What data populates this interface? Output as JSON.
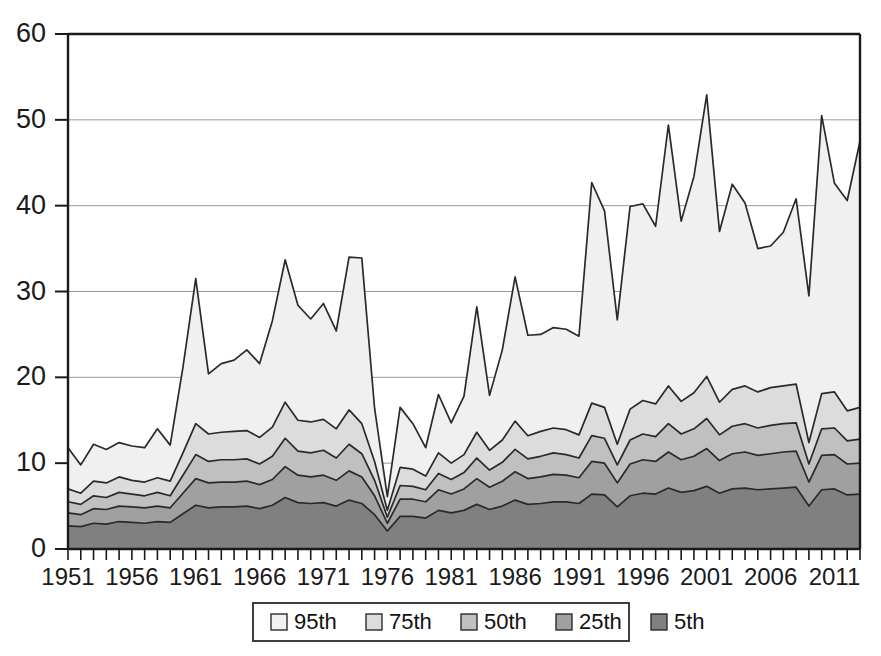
{
  "chart_data": {
    "type": "area",
    "stacked": false,
    "title": "",
    "subtitle": "",
    "xlabel": "",
    "ylabel": "",
    "xlim": [
      1951,
      2013
    ],
    "ylim": [
      0,
      60
    ],
    "ytick_values": [
      0,
      10,
      20,
      30,
      40,
      50,
      60
    ],
    "ytick_labels": [
      "0",
      "10",
      "20",
      "30",
      "40",
      "50",
      "60"
    ],
    "xtick_labels": [
      "1951",
      "1956",
      "1961",
      "1966",
      "1971",
      "1976",
      "1981",
      "1986",
      "1991",
      "1996",
      "2001",
      "2006",
      "2011"
    ],
    "xtick_values": [
      1951,
      1956,
      1961,
      1966,
      1971,
      1976,
      1981,
      1986,
      1991,
      1996,
      2001,
      2006,
      2011
    ],
    "grid": "horizontal",
    "legend_position": "bottom",
    "x": [
      1951,
      1952,
      1953,
      1954,
      1955,
      1956,
      1957,
      1958,
      1959,
      1960,
      1961,
      1962,
      1963,
      1964,
      1965,
      1966,
      1967,
      1968,
      1969,
      1970,
      1971,
      1972,
      1973,
      1974,
      1975,
      1976,
      1977,
      1978,
      1979,
      1980,
      1981,
      1982,
      1983,
      1984,
      1985,
      1986,
      1987,
      1988,
      1989,
      1990,
      1991,
      1992,
      1993,
      1994,
      1995,
      1996,
      1997,
      1998,
      1999,
      2000,
      2001,
      2002,
      2003,
      2004,
      2005,
      2006,
      2007,
      2008,
      2009,
      2010,
      2011,
      2012,
      2013
    ],
    "series": [
      {
        "name": "95th",
        "color": "#f0f0f0",
        "values": [
          11.8,
          9.8,
          12.2,
          11.6,
          12.4,
          12.0,
          11.8,
          14.0,
          12.1,
          21.2,
          31.5,
          20.4,
          21.6,
          22.0,
          23.2,
          21.6,
          26.6,
          33.7,
          28.4,
          26.8,
          28.6,
          25.4,
          34.0,
          33.9,
          16.4,
          6.1,
          16.5,
          14.6,
          11.8,
          18.0,
          14.7,
          17.8,
          28.2,
          17.9,
          23.2,
          31.7,
          24.9,
          25.0,
          25.8,
          25.6,
          24.8,
          42.7,
          39.4,
          26.7,
          39.9,
          40.2,
          37.6,
          49.4,
          38.2,
          43.4,
          52.9,
          37.0,
          42.5,
          40.3,
          35.0,
          35.3,
          36.9,
          40.8,
          29.5,
          50.5,
          42.6,
          40.6,
          47.5
        ]
      },
      {
        "name": "75th",
        "color": "#dcdcdc",
        "values": [
          7.0,
          6.5,
          7.9,
          7.7,
          8.4,
          8.0,
          7.8,
          8.3,
          7.9,
          11.2,
          14.6,
          13.4,
          13.6,
          13.7,
          13.8,
          13.0,
          14.2,
          17.1,
          15.0,
          14.8,
          15.1,
          14.0,
          16.2,
          14.6,
          10.2,
          4.5,
          9.5,
          9.3,
          8.5,
          11.2,
          10.0,
          11.0,
          13.6,
          11.5,
          12.7,
          14.9,
          13.2,
          13.7,
          14.1,
          13.9,
          13.3,
          17.0,
          16.5,
          12.2,
          16.3,
          17.3,
          16.9,
          19.0,
          17.2,
          18.2,
          20.1,
          17.1,
          18.6,
          19.0,
          18.3,
          18.8,
          19.0,
          19.2,
          12.4,
          18.1,
          18.3,
          16.1,
          16.5
        ]
      },
      {
        "name": "50th",
        "color": "#c0c0c0",
        "values": [
          5.5,
          5.2,
          6.2,
          6.0,
          6.6,
          6.4,
          6.2,
          6.6,
          6.2,
          8.6,
          11.0,
          10.2,
          10.4,
          10.4,
          10.5,
          9.9,
          10.8,
          12.9,
          11.4,
          11.2,
          11.5,
          10.6,
          12.2,
          11.1,
          8.0,
          3.7,
          7.4,
          7.3,
          6.9,
          8.8,
          8.1,
          8.9,
          10.6,
          9.2,
          10.1,
          11.6,
          10.5,
          10.8,
          11.2,
          11.0,
          10.6,
          13.2,
          12.9,
          9.8,
          12.7,
          13.4,
          13.1,
          14.6,
          13.4,
          14.0,
          15.2,
          13.3,
          14.3,
          14.6,
          14.1,
          14.4,
          14.6,
          14.7,
          9.9,
          14.0,
          14.1,
          12.6,
          12.8
        ]
      },
      {
        "name": "25th",
        "color": "#a0a0a0",
        "values": [
          4.2,
          4.0,
          4.7,
          4.6,
          5.0,
          4.9,
          4.8,
          5.0,
          4.8,
          6.5,
          8.2,
          7.7,
          7.8,
          7.8,
          7.9,
          7.5,
          8.1,
          9.6,
          8.6,
          8.4,
          8.6,
          8.0,
          9.1,
          8.4,
          6.2,
          3.0,
          5.8,
          5.8,
          5.5,
          6.9,
          6.4,
          7.0,
          8.2,
          7.2,
          7.9,
          9.0,
          8.2,
          8.4,
          8.7,
          8.6,
          8.3,
          10.2,
          10.0,
          7.7,
          9.9,
          10.4,
          10.2,
          11.3,
          10.4,
          10.8,
          11.7,
          10.3,
          11.1,
          11.3,
          10.9,
          11.1,
          11.3,
          11.4,
          7.8,
          10.9,
          11.0,
          9.9,
          10.0
        ]
      },
      {
        "name": "5th",
        "color": "#808080",
        "values": [
          2.7,
          2.6,
          3.0,
          2.9,
          3.2,
          3.1,
          3.0,
          3.2,
          3.1,
          4.1,
          5.1,
          4.8,
          4.9,
          4.9,
          5.0,
          4.7,
          5.1,
          6.0,
          5.4,
          5.3,
          5.4,
          5.0,
          5.7,
          5.3,
          4.0,
          2.1,
          3.8,
          3.8,
          3.6,
          4.5,
          4.2,
          4.5,
          5.2,
          4.6,
          5.0,
          5.7,
          5.2,
          5.3,
          5.5,
          5.5,
          5.3,
          6.4,
          6.3,
          4.9,
          6.2,
          6.5,
          6.4,
          7.1,
          6.6,
          6.8,
          7.3,
          6.5,
          7.0,
          7.1,
          6.9,
          7.0,
          7.1,
          7.2,
          5.0,
          6.9,
          7.0,
          6.3,
          6.4
        ]
      }
    ],
    "legend_entries": [
      {
        "label": "95th",
        "color": "#f0f0f0"
      },
      {
        "label": "75th",
        "color": "#dcdcdc"
      },
      {
        "label": "50th",
        "color": "#c0c0c0"
      },
      {
        "label": "25th",
        "color": "#a0a0a0"
      },
      {
        "label": "5th",
        "color": "#808080"
      }
    ]
  }
}
